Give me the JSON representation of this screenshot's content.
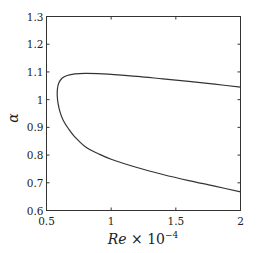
{
  "chart_data": {
    "type": "line",
    "title": "",
    "xlabel": "Re × 10^-4",
    "xlabel_parts": {
      "main": "Re",
      "times": " × 10",
      "exp": "−4"
    },
    "ylabel": "α",
    "xlim": [
      0.5,
      2
    ],
    "ylim": [
      0.6,
      1.3
    ],
    "xticks": [
      0.5,
      1,
      1.5,
      2
    ],
    "xtick_labels": [
      "0.5",
      "1",
      "1.5",
      "2"
    ],
    "yticks": [
      0.6,
      0.7,
      0.8,
      0.9,
      1.0,
      1.1,
      1.2,
      1.3
    ],
    "ytick_labels": [
      "0.6",
      "0.7",
      "0.8",
      "0.9",
      "1",
      "1.1",
      "1.2",
      "1.3"
    ],
    "grid": false,
    "legend": null,
    "series": [
      {
        "name": "neutral stability curve",
        "color": "#333333",
        "x": [
          2.0,
          1.8,
          1.6,
          1.4,
          1.2,
          1.0,
          0.9,
          0.8,
          0.72,
          0.66,
          0.62,
          0.595,
          0.585,
          0.583,
          0.59,
          0.605,
          0.63,
          0.67,
          0.72,
          0.8,
          0.9,
          1.0,
          1.2,
          1.4,
          1.6,
          1.8,
          2.0
        ],
        "y": [
          1.045,
          1.056,
          1.066,
          1.075,
          1.084,
          1.091,
          1.094,
          1.095,
          1.093,
          1.087,
          1.077,
          1.06,
          1.04,
          1.015,
          0.985,
          0.955,
          0.925,
          0.895,
          0.865,
          0.83,
          0.805,
          0.785,
          0.755,
          0.73,
          0.708,
          0.688,
          0.667
        ]
      }
    ]
  }
}
